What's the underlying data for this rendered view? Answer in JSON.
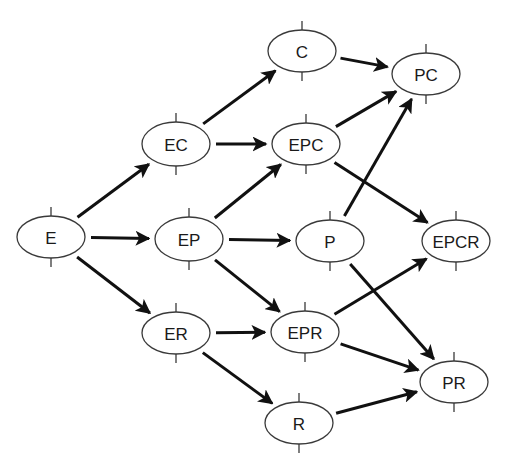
{
  "diagram": {
    "type": "directed-graph",
    "colors": {
      "node_stroke": "#3a3a3a",
      "edge": "#111111",
      "text": "#1a1a1a",
      "background": "#ffffff"
    },
    "nodes": [
      {
        "id": "E",
        "label": "E",
        "x": 51,
        "y": 237,
        "rx": 34,
        "ry": 21
      },
      {
        "id": "EC",
        "label": "EC",
        "x": 176,
        "y": 144,
        "rx": 34,
        "ry": 22
      },
      {
        "id": "EP",
        "label": "EP",
        "x": 189,
        "y": 239,
        "rx": 34,
        "ry": 22
      },
      {
        "id": "ER",
        "label": "ER",
        "x": 176,
        "y": 333,
        "rx": 34,
        "ry": 21
      },
      {
        "id": "C",
        "label": "C",
        "x": 302,
        "y": 51,
        "rx": 34,
        "ry": 21
      },
      {
        "id": "EPC",
        "label": "EPC",
        "x": 306,
        "y": 144,
        "rx": 34,
        "ry": 21
      },
      {
        "id": "P",
        "label": "P",
        "x": 330,
        "y": 241,
        "rx": 34,
        "ry": 21
      },
      {
        "id": "EPR",
        "label": "EPR",
        "x": 305,
        "y": 332,
        "rx": 34,
        "ry": 21
      },
      {
        "id": "R",
        "label": "R",
        "x": 299,
        "y": 423,
        "rx": 34,
        "ry": 21
      },
      {
        "id": "PC",
        "label": "PC",
        "x": 426,
        "y": 74,
        "rx": 34,
        "ry": 21
      },
      {
        "id": "EPCR",
        "label": "EPCR",
        "x": 456,
        "y": 241,
        "rx": 34,
        "ry": 21
      },
      {
        "id": "PR",
        "label": "PR",
        "x": 454,
        "y": 382,
        "rx": 34,
        "ry": 21
      }
    ],
    "edges": [
      {
        "from": "E",
        "to": "EC"
      },
      {
        "from": "E",
        "to": "EP"
      },
      {
        "from": "E",
        "to": "ER"
      },
      {
        "from": "EC",
        "to": "C"
      },
      {
        "from": "EC",
        "to": "EPC"
      },
      {
        "from": "EP",
        "to": "EPC"
      },
      {
        "from": "EP",
        "to": "P"
      },
      {
        "from": "EP",
        "to": "EPR"
      },
      {
        "from": "ER",
        "to": "EPR"
      },
      {
        "from": "ER",
        "to": "R"
      },
      {
        "from": "C",
        "to": "PC"
      },
      {
        "from": "EPC",
        "to": "PC"
      },
      {
        "from": "EPC",
        "to": "EPCR"
      },
      {
        "from": "P",
        "to": "PC"
      },
      {
        "from": "P",
        "to": "PR"
      },
      {
        "from": "EPR",
        "to": "EPCR"
      },
      {
        "from": "EPR",
        "to": "PR"
      },
      {
        "from": "R",
        "to": "PR"
      }
    ]
  }
}
